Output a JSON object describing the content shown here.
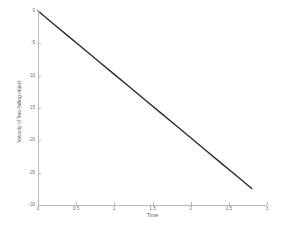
{
  "chart_data": {
    "type": "line",
    "title": "",
    "xlabel": "Time",
    "ylabel": "Velocity of free-falling object",
    "xlim": [
      0,
      3
    ],
    "ylim": [
      -30,
      0
    ],
    "grid": false,
    "legend": null,
    "xticks": [
      0,
      0.5,
      1,
      1.5,
      2,
      2.5,
      3
    ],
    "xticklabels": [
      "0",
      "0.5",
      "1",
      "1.5",
      "2",
      "2.5",
      "3"
    ],
    "yticks": [
      0,
      -5,
      -10,
      -15,
      -20,
      -25,
      -30
    ],
    "yticklabels": [
      "0",
      "-5",
      "-10",
      "-15",
      "-20",
      "-25",
      "-30"
    ],
    "series": [
      {
        "name": "velocity",
        "color": "#2b2b2b",
        "linewidth": 1.4,
        "x": [
          0,
          0.2,
          0.4,
          0.6,
          0.8,
          1.0,
          1.2,
          1.4,
          1.6,
          1.8,
          2.0,
          2.2,
          2.4,
          2.6,
          2.8
        ],
        "y": [
          0,
          -1.96,
          -3.92,
          -5.88,
          -7.84,
          -9.8,
          -11.76,
          -13.72,
          -15.68,
          -17.64,
          -19.6,
          -21.56,
          -23.52,
          -25.48,
          -27.44
        ]
      }
    ],
    "axis_color": "#b9b9b9",
    "background": "#ffffff"
  }
}
